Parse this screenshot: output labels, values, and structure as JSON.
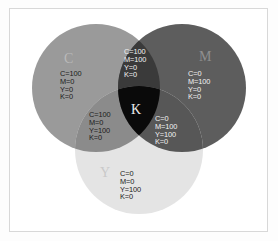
{
  "figure": {
    "background_color": "#ffffff",
    "frame_color": "#d8d8d8"
  },
  "sets": [
    {
      "id": "cyan",
      "letter": "C",
      "name": "Cyan",
      "fill": "#9a9a9a",
      "values": {
        "C": 100,
        "M": 0,
        "Y": 0,
        "K": 0
      },
      "value_text": "C=100\nM=0\nY=0\nK=0"
    },
    {
      "id": "magenta",
      "letter": "M",
      "name": "Magenta",
      "fill": "#5d5d5d",
      "values": {
        "C": 0,
        "M": 100,
        "Y": 0,
        "K": 0
      },
      "value_text": "C=0\nM=100\nY=0\nK=0"
    },
    {
      "id": "yellow",
      "letter": "Y",
      "name": "Yellow",
      "fill": "#e4e4e4",
      "values": {
        "C": 0,
        "M": 0,
        "Y": 100,
        "K": 0
      },
      "value_text": "C=0\nM=0\nY=100\nK=0"
    }
  ],
  "intersections": [
    {
      "id": "cyan-magenta",
      "name": "Blue",
      "fill": "#3a3a3a",
      "values": {
        "C": 100,
        "M": 100,
        "Y": 0,
        "K": 0
      },
      "value_text": "C=100\nM=100\nY=0\nK=0"
    },
    {
      "id": "cyan-yellow",
      "name": "Green",
      "fill": "#8b8b8b",
      "values": {
        "C": 100,
        "M": 0,
        "Y": 100,
        "K": 0
      },
      "value_text": "C=100\nM=0\nY=100\nK=0"
    },
    {
      "id": "magenta-yellow",
      "name": "Red",
      "fill": "#575757",
      "values": {
        "C": 0,
        "M": 100,
        "Y": 100,
        "K": 0
      },
      "value_text": "C=0\nM=100\nY=100\nK=0"
    }
  ],
  "center": {
    "id": "k",
    "letter": "K",
    "name": "Key / Black",
    "fill": "#0a0a0a",
    "values": {
      "C": 100,
      "M": 100,
      "Y": 100,
      "K": 0
    }
  }
}
